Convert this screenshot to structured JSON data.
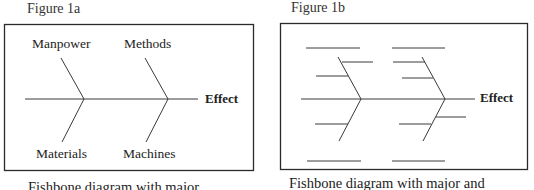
{
  "figures": [
    {
      "title": "Figure 1a",
      "caption": "Fishbone diagram with major",
      "effect_label": "Effect",
      "categories": {
        "top_left": "Manpower",
        "top_right": "Methods",
        "bottom_left": "Materials",
        "bottom_right": "Machines"
      }
    },
    {
      "title": "Figure 1b",
      "caption": "Fishbone diagram with major and",
      "effect_label": "Effect"
    }
  ],
  "colors": {
    "line": "#3a3a3a",
    "box": "#2a2a2a",
    "background": "#ffffff"
  }
}
